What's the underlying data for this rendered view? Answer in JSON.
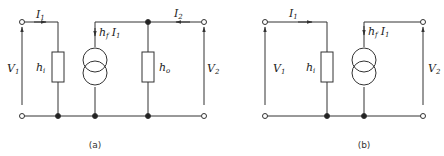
{
  "diagrams": [
    {
      "id": "a",
      "caption": "(a)",
      "labels": {
        "input_current": "I",
        "input_current_sub": "1",
        "output_current": "I",
        "output_current_sub": "2",
        "input_voltage": "V",
        "input_voltage_sub": "1",
        "output_voltage": "V",
        "output_voltage_sub": "2",
        "input_impedance": "h",
        "input_impedance_sub": "i",
        "output_admittance": "h",
        "output_admittance_sub": "o",
        "source": "h",
        "source_sub": "f",
        "source_current": "I",
        "source_current_sub": "1"
      }
    },
    {
      "id": "b",
      "caption": "(b)",
      "labels": {
        "input_current": "I",
        "input_current_sub": "1",
        "input_voltage": "V",
        "input_voltage_sub": "1",
        "output_voltage": "V",
        "output_voltage_sub": "2",
        "input_impedance": "h",
        "input_impedance_sub": "i",
        "source": "h",
        "source_sub": "f",
        "source_current": "I",
        "source_current_sub": "1"
      }
    }
  ],
  "colors": {
    "line": "#333333",
    "background": "#ffffff"
  }
}
